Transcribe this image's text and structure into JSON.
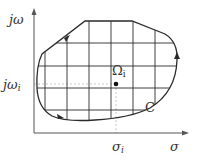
{
  "figure": {
    "type": "complex-plane region diagram",
    "axes": {
      "y_label": "jω",
      "x_label": "σ"
    },
    "point": {
      "label_base": "Ω",
      "label_sub": "i",
      "sigma_label_base": "σ",
      "sigma_label_sub": "i",
      "jomega_label_base": "jω",
      "jomega_label_sub": "i"
    },
    "contour_label": "C",
    "colors": {
      "stroke": "#2a2a2a",
      "axis": "#555555",
      "dashed": "#bbbbbb",
      "text": "#333333"
    }
  }
}
